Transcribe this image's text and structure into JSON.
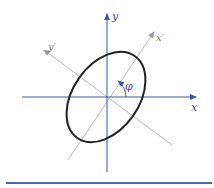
{
  "diagram": {
    "labels": {
      "x_axis": "x",
      "y_axis": "y",
      "x_prime_axis": "x′",
      "y_prime_axis": "y′",
      "angle": "φ"
    },
    "colors": {
      "axes": "#3a55b4",
      "rotated_axes": "#b8b8b8",
      "ellipse": "#222222",
      "rule": "#4a63c0"
    },
    "ellipse": {
      "center": [
        106,
        97
      ],
      "semi_major": 50,
      "semi_minor": 33,
      "rotation_deg": -55
    }
  }
}
